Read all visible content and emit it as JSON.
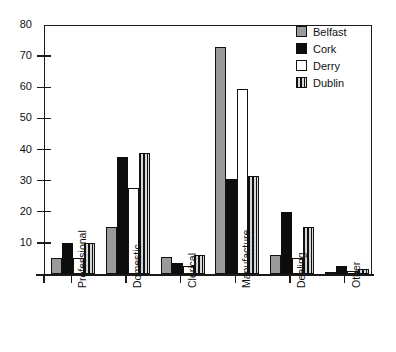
{
  "chart_data": {
    "type": "bar",
    "title": "",
    "xlabel": "",
    "ylabel": "",
    "ylim": [
      0,
      80
    ],
    "yticks": [
      0,
      10,
      20,
      30,
      40,
      50,
      60,
      70,
      80
    ],
    "ytick_labels": [
      "",
      "10",
      "20",
      "30",
      "40",
      "50",
      "60",
      "70",
      "80"
    ],
    "grid": false,
    "legend_position": "top-right",
    "categories": [
      "Professional",
      "Domestic",
      "Clerical",
      "Manufacture",
      "Dealing",
      "Other"
    ],
    "series": [
      {
        "name": "Belfast",
        "color": "#9a9a9a",
        "fill": "solid-gray",
        "values": [
          5,
          15,
          5.5,
          73,
          6,
          0.5
        ]
      },
      {
        "name": "Cork",
        "color": "#0d0d0d",
        "fill": "solid-black",
        "values": [
          10,
          37.5,
          3.5,
          30.5,
          20,
          2.5
        ]
      },
      {
        "name": "Derry",
        "color": "#ffffff",
        "fill": "open-white",
        "values": [
          5,
          27.5,
          2.5,
          59.5,
          5,
          1
        ]
      },
      {
        "name": "Dublin",
        "color": "#111111",
        "fill": "vertical-hatch",
        "values": [
          10,
          39,
          6,
          31.5,
          15,
          1.5
        ]
      }
    ]
  },
  "legend": {
    "items": [
      {
        "label": "Belfast",
        "swatch": "solid-gray"
      },
      {
        "label": "Cork",
        "swatch": "solid-black"
      },
      {
        "label": "Derry",
        "swatch": "open-white"
      },
      {
        "label": "Dublin",
        "swatch": "vertical-hatch"
      }
    ]
  },
  "axes": {
    "y": {
      "labels": [
        "80",
        "70",
        "60",
        "50",
        "40",
        "30",
        "20",
        "10"
      ]
    },
    "x": {
      "labels": [
        "Professional",
        "Domestic",
        "Clerical",
        "Manufacture",
        "Dealing",
        "Other"
      ]
    }
  },
  "colors": {
    "axis": "#1a1a1a",
    "belfast": "#9a9a9a",
    "cork": "#0d0d0d",
    "derry": "#ffffff",
    "dublin": "#111111",
    "background": "#ffffff"
  }
}
